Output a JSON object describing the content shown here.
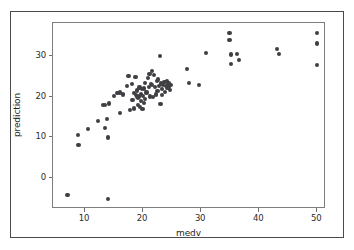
{
  "figure": {
    "background_color": "#ffffff",
    "border_color": "#4a4a4a",
    "axes_edge_color": "#7d7d7d",
    "marker_color": "#3f3f44"
  },
  "chart_data": {
    "type": "scatter",
    "title": "",
    "xlabel": "medv",
    "ylabel": "prediction",
    "xlim": [
      4.5,
      51.5
    ],
    "ylim": [
      -7.5,
      38.0
    ],
    "xticks": [
      10,
      20,
      30,
      40,
      50
    ],
    "xticklabels": [
      "10",
      "20",
      "30",
      "40",
      "50"
    ],
    "yticks": [
      0,
      10,
      20,
      30
    ],
    "yticklabels": [
      "0",
      "10",
      "20",
      "30"
    ],
    "grid": false,
    "legend": false,
    "marker": "circle",
    "marker_size": 4,
    "marker_color": "#3f3f44",
    "n_points": 85,
    "points": [
      [
        7.0,
        -4.0
      ],
      [
        8.8,
        10.7
      ],
      [
        8.9,
        8.2
      ],
      [
        10.5,
        12.0
      ],
      [
        12.2,
        14.0
      ],
      [
        13.1,
        18.0
      ],
      [
        13.4,
        12.3
      ],
      [
        13.5,
        17.9
      ],
      [
        13.8,
        14.6
      ],
      [
        13.9,
        10.0
      ],
      [
        14.0,
        -5.0
      ],
      [
        14.2,
        18.3
      ],
      [
        15.0,
        20.1
      ],
      [
        15.6,
        20.8
      ],
      [
        16.0,
        21.0
      ],
      [
        16.1,
        16.0
      ],
      [
        16.6,
        20.5
      ],
      [
        17.2,
        22.6
      ],
      [
        17.5,
        25.0
      ],
      [
        17.8,
        16.8
      ],
      [
        18.1,
        23.0
      ],
      [
        18.2,
        19.2
      ],
      [
        18.4,
        20.9
      ],
      [
        18.5,
        17.1
      ],
      [
        18.7,
        24.7
      ],
      [
        18.8,
        20.3
      ],
      [
        18.9,
        19.8
      ],
      [
        19.0,
        21.5
      ],
      [
        19.1,
        18.0
      ],
      [
        19.2,
        19.6
      ],
      [
        19.3,
        20.0
      ],
      [
        19.4,
        22.2
      ],
      [
        19.5,
        17.5
      ],
      [
        19.6,
        20.6
      ],
      [
        19.7,
        19.0
      ],
      [
        19.8,
        21.8
      ],
      [
        19.9,
        17.0
      ],
      [
        20.0,
        20.2
      ],
      [
        20.1,
        18.5
      ],
      [
        20.2,
        22.0
      ],
      [
        20.3,
        19.4
      ],
      [
        20.4,
        23.4
      ],
      [
        20.6,
        21.0
      ],
      [
        20.8,
        24.6
      ],
      [
        21.0,
        22.4
      ],
      [
        21.1,
        25.5
      ],
      [
        21.2,
        20.0
      ],
      [
        21.4,
        23.0
      ],
      [
        21.5,
        26.2
      ],
      [
        21.6,
        22.8
      ],
      [
        21.7,
        19.8
      ],
      [
        21.9,
        25.3
      ],
      [
        22.0,
        22.3
      ],
      [
        22.2,
        20.5
      ],
      [
        22.4,
        23.9
      ],
      [
        22.5,
        21.4
      ],
      [
        22.6,
        24.2
      ],
      [
        22.8,
        22.6
      ],
      [
        22.9,
        29.9
      ],
      [
        23.0,
        18.1
      ],
      [
        23.1,
        23.2
      ],
      [
        23.2,
        20.4
      ],
      [
        23.3,
        21.8
      ],
      [
        23.5,
        22.9
      ],
      [
        23.7,
        23.6
      ],
      [
        23.8,
        21.2
      ],
      [
        24.0,
        22.5
      ],
      [
        24.1,
        23.8
      ],
      [
        24.2,
        22.1
      ],
      [
        24.3,
        22.9
      ],
      [
        24.4,
        23.3
      ],
      [
        24.5,
        22.4
      ],
      [
        24.6,
        21.7
      ],
      [
        24.8,
        22.8
      ],
      [
        27.5,
        26.7
      ],
      [
        27.9,
        23.4
      ],
      [
        29.6,
        22.9
      ],
      [
        30.8,
        30.6
      ],
      [
        34.9,
        35.6
      ],
      [
        34.9,
        33.9
      ],
      [
        35.1,
        30.3
      ],
      [
        35.2,
        28.0
      ],
      [
        36.2,
        30.5
      ],
      [
        36.5,
        28.9
      ],
      [
        43.1,
        31.6
      ],
      [
        43.4,
        30.4
      ],
      [
        50.0,
        35.6
      ],
      [
        50.0,
        33.0
      ],
      [
        50.0,
        27.8
      ]
    ]
  }
}
